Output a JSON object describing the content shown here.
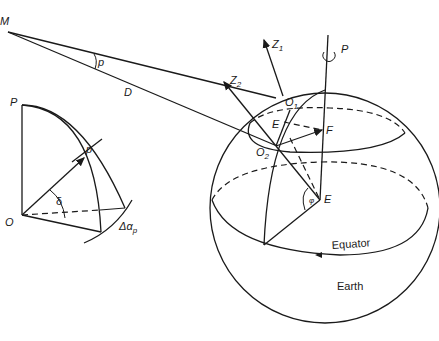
{
  "diagram": {
    "type": "astronomy-parallax-geometry",
    "left_figure": {
      "labels": {
        "moon": "M",
        "parallax_angle": "p",
        "distance": "D",
        "pole": "P",
        "origin": "O",
        "declination": "δ",
        "parallax_small": "p",
        "delta_alpha": "Δα",
        "delta_alpha_sub": "p"
      }
    },
    "right_figure": {
      "labels": {
        "zenith_1": "Z",
        "zenith_1_sub": "1",
        "zenith_2": "Z",
        "zenith_2_sub": "2",
        "pole": "P",
        "observer_1": "O",
        "observer_1_sub": "1",
        "observer_2": "O",
        "observer_2_sub": "2",
        "point_e_small": "E",
        "point_f": "F",
        "center": "E",
        "latitude_angle": "φ",
        "equator": "Equator",
        "earth": "Earth"
      }
    }
  }
}
